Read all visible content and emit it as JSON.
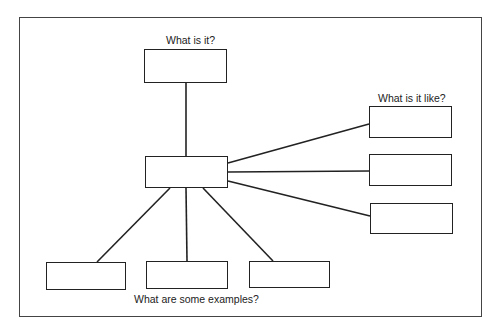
{
  "diagram": {
    "type": "concept-map",
    "labels": {
      "top": "What is it?",
      "right": "What is it like?",
      "bottom": "What are some examples?"
    },
    "nodes": [
      {
        "id": "center",
        "text": ""
      },
      {
        "id": "definition",
        "text": ""
      },
      {
        "id": "property-1",
        "text": ""
      },
      {
        "id": "property-2",
        "text": ""
      },
      {
        "id": "property-3",
        "text": ""
      },
      {
        "id": "example-1",
        "text": ""
      },
      {
        "id": "example-2",
        "text": ""
      },
      {
        "id": "example-3",
        "text": ""
      }
    ],
    "edges": [
      [
        "center",
        "definition"
      ],
      [
        "center",
        "property-1"
      ],
      [
        "center",
        "property-2"
      ],
      [
        "center",
        "property-3"
      ],
      [
        "center",
        "example-1"
      ],
      [
        "center",
        "example-2"
      ],
      [
        "center",
        "example-3"
      ]
    ],
    "colors": {
      "line": "#222222",
      "frame": "#444444",
      "background": "#ffffff"
    }
  }
}
